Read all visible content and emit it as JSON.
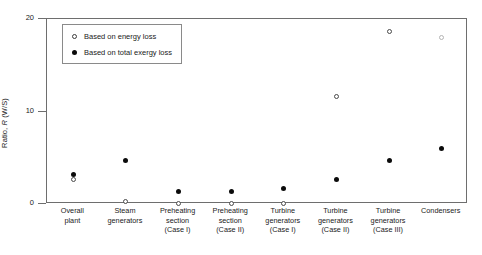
{
  "chart_data": {
    "type": "scatter",
    "title": "",
    "xlabel": "",
    "ylabel": "Ratio, R (W/S)",
    "ylabel_prefix": "Ratio, ",
    "ylabel_italic": "R",
    "ylabel_suffix": " (W/S)",
    "ylim": [
      0,
      20
    ],
    "yticks": [
      0,
      10,
      20
    ],
    "ytick_labels": [
      "0",
      "10",
      "20"
    ],
    "grid": false,
    "legend_position": "top-left",
    "categories": [
      "Overall plant",
      "Steam generators",
      "Preheating section (Case I)",
      "Preheating section (Case II)",
      "Turbine generators (Case I)",
      "Turbine generators (Case II)",
      "Turbine generators (Case III)",
      "Condensers"
    ],
    "category_lines": [
      [
        "Overall",
        "plant"
      ],
      [
        "Steam",
        "generators"
      ],
      [
        "Preheating",
        "section",
        "(Case I)"
      ],
      [
        "Preheating",
        "section",
        "(Case II)"
      ],
      [
        "Turbine",
        "generators",
        "(Case I)"
      ],
      [
        "Turbine",
        "generators",
        "(Case II)"
      ],
      [
        "Turbine",
        "generators",
        "(Case III)"
      ],
      [
        "Condensers"
      ]
    ],
    "series": [
      {
        "name": "Based on energy loss",
        "marker": "open-circle",
        "values": [
          2.7,
          0.3,
          0.1,
          0.05,
          0.05,
          11.6,
          18.6,
          18.0
        ]
      },
      {
        "name": "Based on total exergy loss",
        "marker": "filled-circle",
        "values": [
          3.2,
          4.7,
          1.4,
          1.3,
          1.7,
          2.6,
          4.7,
          6.0
        ]
      }
    ]
  },
  "legend": {
    "entries": [
      {
        "label": "Based on energy loss",
        "marker": "open-circle"
      },
      {
        "label": "Based on total exergy loss",
        "marker": "filled-circle"
      }
    ]
  },
  "colors": {
    "axis": "#6e6e6e",
    "marker_filled": "#0b0b0b",
    "marker_open_edge": "#4a4a4a",
    "background": "#ffffff"
  }
}
